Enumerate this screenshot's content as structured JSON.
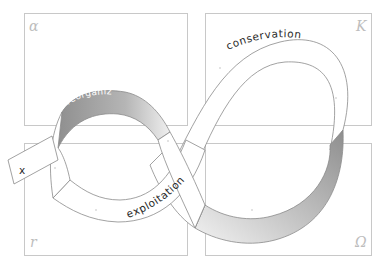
{
  "diagram": {
    "quadrants": [
      {
        "id": "alpha",
        "symbol": "α",
        "position": "top-left"
      },
      {
        "id": "K",
        "symbol": "K",
        "position": "top-right"
      },
      {
        "id": "r",
        "symbol": "r",
        "position": "bottom-left"
      },
      {
        "id": "omega",
        "symbol": "Ω",
        "position": "bottom-right"
      }
    ],
    "phases": {
      "reorganization": "reorganization",
      "conservation": "conservation",
      "exploitation": "exploitation",
      "release": "release"
    },
    "exit_label": "x",
    "colors": {
      "box_stroke": "#c8c8c8",
      "band_stroke": "#8a8a8a",
      "band_fill": "#ffffff",
      "shade_dark": "#9a9a9a",
      "shade_light": "#e6e6e6",
      "greek_symbol": "#bdbdbd"
    }
  }
}
